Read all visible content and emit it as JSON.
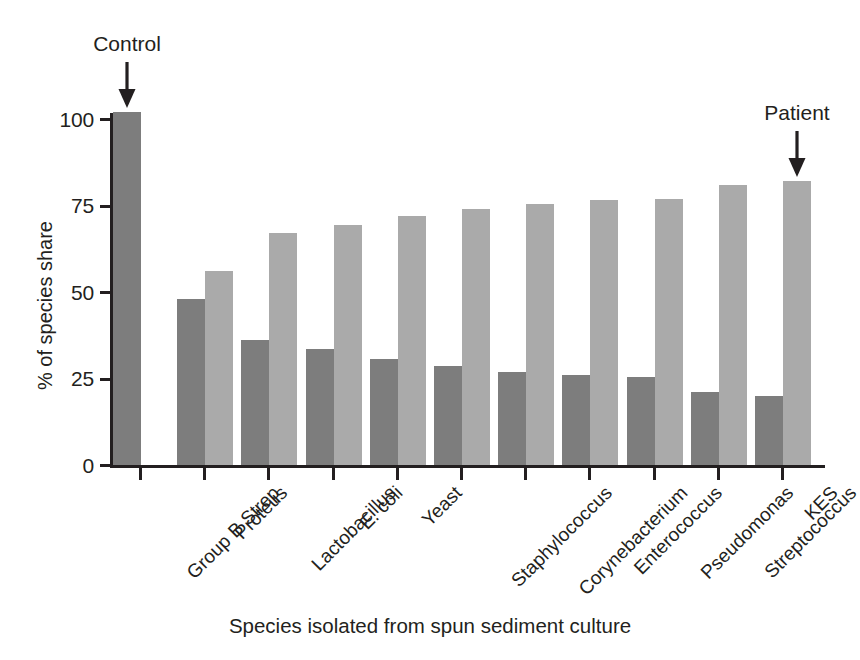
{
  "chart_data": {
    "type": "bar",
    "title": "",
    "xlabel": "Species isolated from spun sediment culture",
    "ylabel": "% of species share",
    "ylim": [
      0,
      110
    ],
    "yticks": [
      0,
      25,
      50,
      75,
      100
    ],
    "ytick_labels": [
      "0",
      "25",
      "50",
      "75",
      "100"
    ],
    "grid": false,
    "legend": "none",
    "categories": [
      "Group B Strep",
      "Proteus",
      "Lactobacillus",
      "E. coli",
      "Yeast",
      "Staphylococcus",
      "Corynebacterium",
      "Enterococcus",
      "Pseudomonas",
      "Streptococcus",
      "KES"
    ],
    "series": [
      {
        "name": "dark-series",
        "color": "#7d7d7d",
        "values": [
          102,
          48,
          36,
          33.5,
          30.5,
          28.5,
          27,
          26,
          25.5,
          21,
          20
        ]
      },
      {
        "name": "light-series",
        "color": "#aaaaaa",
        "values": [
          null,
          56,
          67,
          69.5,
          72,
          74,
          75.5,
          76.5,
          77,
          81,
          82
        ]
      }
    ],
    "annotations": [
      {
        "label": "Control",
        "target_category": "Group B Strep",
        "target_series": "dark-series"
      },
      {
        "label": "Patient",
        "target_category": "KES",
        "target_series": "light-series"
      }
    ]
  },
  "colors": {
    "dark_bar": "#7d7d7d",
    "light_bar": "#aaaaaa",
    "axis": "#231f20",
    "background": "#ffffff"
  }
}
